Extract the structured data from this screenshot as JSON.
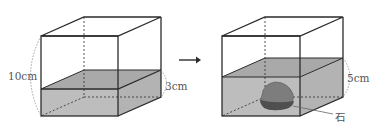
{
  "figure": {
    "left_container": {
      "height_label": "10cm",
      "water_label": "3cm"
    },
    "arrow": "right-arrow",
    "right_container": {
      "water_label": "5cm",
      "stone_label": "石"
    },
    "colors": {
      "line": "#2b2b2b",
      "water_top": "#a9a9a9",
      "water_front": "#bdbdbd",
      "stone": "#7d7d7d",
      "stone_bottom": "#4f4f4f",
      "label": "#555555"
    }
  }
}
